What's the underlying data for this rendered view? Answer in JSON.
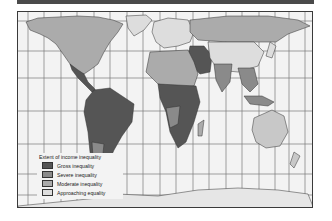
{
  "map": {
    "title": "Extent of income inequality",
    "colors": {
      "ocean": "#f3f3f3",
      "grid": "#7a7a7a",
      "border": "#3a3a3a",
      "gross": "#555555",
      "severe": "#8a8a8a",
      "moderate": "#ababab",
      "approaching": "#dddddd"
    },
    "legend": {
      "title": "Extent of income inequality",
      "items": [
        {
          "label": "Gross inequality",
          "color": "#555555"
        },
        {
          "label": "Severe inequality",
          "color": "#8a8a8a"
        },
        {
          "label": "Moderate inequality",
          "color": "#ababab"
        },
        {
          "label": "Approaching equality",
          "color": "#dddddd"
        }
      ]
    }
  }
}
